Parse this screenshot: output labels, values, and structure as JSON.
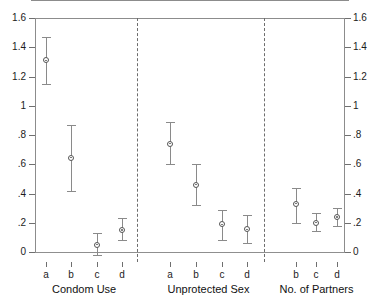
{
  "chart_data": {
    "type": "scatter",
    "title": "",
    "subtitle": "",
    "xlabel": "",
    "ylabel": "",
    "ylim": [
      0,
      1.6
    ],
    "grid": false,
    "legend": null,
    "marker": "open-circle-with-dot",
    "error_bars": "vertical-capped",
    "zero_reference_line": 0,
    "y_ticks": [
      "0",
      ".2",
      ".4",
      ".6",
      ".8",
      "1",
      "1.2",
      "1.4",
      "1.6"
    ],
    "y_tick_values": [
      0,
      0.2,
      0.4,
      0.6,
      0.8,
      1.0,
      1.2,
      1.4,
      1.6
    ],
    "y_axis_right_ticks": [
      "0",
      ".2",
      ".4",
      ".6",
      ".8",
      "1",
      "1.2",
      "1.4",
      "1.6"
    ],
    "panel_separators": 2,
    "groups": [
      {
        "name": "Condom Use",
        "categories": [
          "a",
          "b",
          "c",
          "d"
        ],
        "values": [
          1.31,
          0.645,
          0.05,
          0.15
        ],
        "ci_low": [
          1.15,
          0.42,
          -0.02,
          0.08
        ],
        "ci_high": [
          1.47,
          0.87,
          0.13,
          0.23
        ]
      },
      {
        "name": "Unprotected Sex",
        "categories": [
          "a",
          "b",
          "c",
          "d"
        ],
        "values": [
          0.74,
          0.46,
          0.19,
          0.155
        ],
        "ci_low": [
          0.6,
          0.32,
          0.08,
          0.06
        ],
        "ci_high": [
          0.89,
          0.6,
          0.29,
          0.25
        ]
      },
      {
        "name": "No. of Partners",
        "categories": [
          "b",
          "c",
          "d"
        ],
        "values": [
          0.33,
          0.2,
          0.24
        ],
        "ci_low": [
          0.2,
          0.145,
          0.175
        ],
        "ci_high": [
          0.44,
          0.265,
          0.3
        ]
      }
    ]
  },
  "colors": {
    "axis": "#8c8c8c",
    "marker_edge": "#555555",
    "error_bar": "#8a8a8a",
    "divider": "#6d6d6d",
    "text": "#1c1c1c",
    "background": "#ffffff"
  }
}
